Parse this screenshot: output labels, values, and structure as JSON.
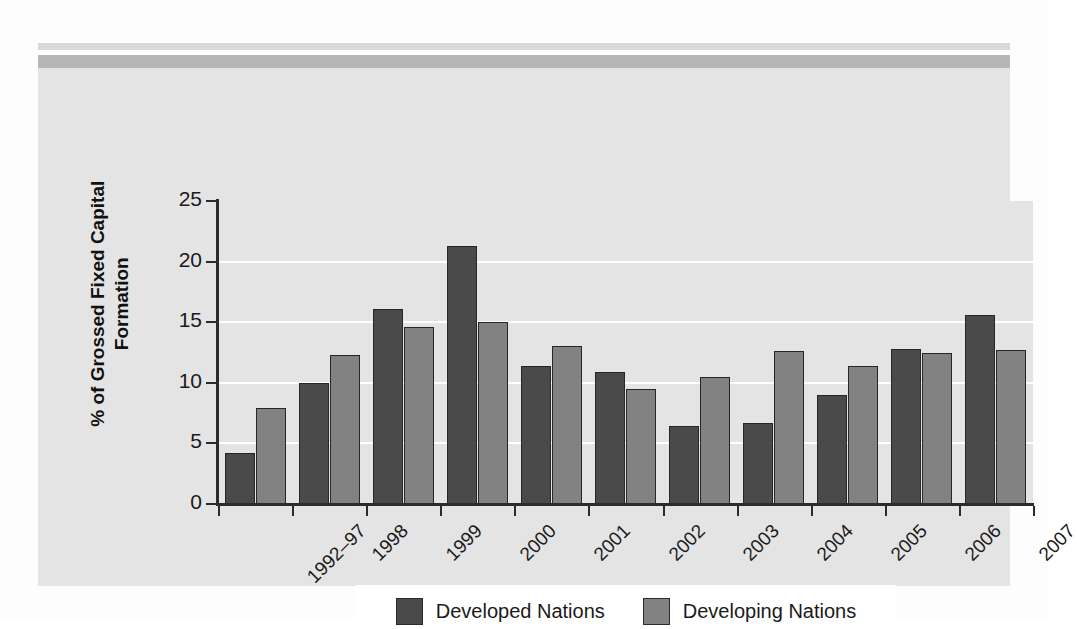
{
  "chart_data": {
    "type": "bar",
    "title": "",
    "xlabel": "",
    "ylabel": "% of Grossed Fixed Capital Formation",
    "ylabel_line1": "% of Grossed Fixed Capital",
    "ylabel_line2": "Formation",
    "ylim": [
      0,
      25
    ],
    "ytick_values": [
      0,
      5,
      10,
      15,
      20,
      25
    ],
    "ytick_labels": [
      "0",
      "5",
      "10",
      "15",
      "20",
      "25"
    ],
    "grid": true,
    "gridlines_at": [
      5,
      10,
      15,
      20
    ],
    "legend_position": "bottom-center",
    "categories": [
      "1992–97",
      "1998",
      "1999",
      "2000",
      "2001",
      "2002",
      "2003",
      "2004",
      "2005",
      "2006",
      "2007"
    ],
    "series": [
      {
        "name": "Developed Nations",
        "color": "#4a4a4a",
        "values": [
          4.2,
          10.0,
          16.1,
          21.3,
          11.4,
          10.9,
          6.4,
          6.7,
          9.0,
          12.8,
          15.6
        ]
      },
      {
        "name": "Developing Nations",
        "color": "#828282",
        "values": [
          7.9,
          12.3,
          14.6,
          15.0,
          13.0,
          9.5,
          10.5,
          12.6,
          11.4,
          12.5,
          12.7
        ]
      }
    ]
  },
  "legend": {
    "entries": [
      {
        "label": "Developed Nations",
        "swatch": "dark-gray-swatch"
      },
      {
        "label": "Developing Nations",
        "swatch": "light-gray-swatch"
      }
    ]
  },
  "colors": {
    "panel_background": "#e4e4e4",
    "page_background": "#fdfdfd",
    "band_thin": "#d9d9d9",
    "band_thick": "#b6b6b6",
    "axis": "#2b2b2b",
    "gridline": "#ffffff",
    "developed": "#4a4a4a",
    "developing": "#828282",
    "legend_background": "#ffffff"
  }
}
